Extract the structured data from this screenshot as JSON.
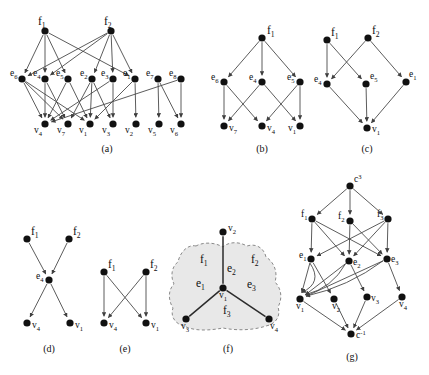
{
  "figure": {
    "background": "#ffffff",
    "node_color": "#111111",
    "edge_color": "#4a4a4a",
    "blob_fill": "#e8e8e8",
    "blob_stroke": "#8a8a8a"
  },
  "captions": {
    "a": "(a)",
    "b": "(b)",
    "c": "(c)",
    "d": "(d)",
    "e": "(e)",
    "f": "(f)",
    "g": "(g)"
  },
  "panels": {
    "a": {
      "caption": "(a)",
      "nodes": [
        {
          "id": "f1",
          "base": "f",
          "sub": "1",
          "x": 45,
          "y": 31,
          "label_dx": -7,
          "label_dy": -6,
          "big": true
        },
        {
          "id": "f2",
          "base": "f",
          "sub": "2",
          "x": 111,
          "y": 31,
          "label_dx": -7,
          "label_dy": -6,
          "big": true
        },
        {
          "id": "e6",
          "base": "e",
          "sub": "6",
          "x": 22,
          "y": 79,
          "label_dx": -12,
          "label_dy": -3
        },
        {
          "id": "e4",
          "base": "e",
          "sub": "4",
          "x": 45,
          "y": 79,
          "label_dx": -12,
          "label_dy": -3
        },
        {
          "id": "e5",
          "base": "e",
          "sub": "5",
          "x": 68,
          "y": 79,
          "label_dx": -12,
          "label_dy": -3
        },
        {
          "id": "e2",
          "base": "e",
          "sub": "2",
          "x": 92,
          "y": 79,
          "label_dx": -12,
          "label_dy": -3
        },
        {
          "id": "e3",
          "base": "e",
          "sub": "3",
          "x": 113,
          "y": 79,
          "label_dx": -12,
          "label_dy": -3
        },
        {
          "id": "e1",
          "base": "e",
          "sub": "1",
          "x": 135,
          "y": 79,
          "label_dx": -12,
          "label_dy": -3
        },
        {
          "id": "e7",
          "base": "e",
          "sub": "7",
          "x": 158,
          "y": 79,
          "label_dx": -12,
          "label_dy": -3
        },
        {
          "id": "e8",
          "base": "e",
          "sub": "8",
          "x": 181,
          "y": 79,
          "label_dx": -12,
          "label_dy": -3
        },
        {
          "id": "v4",
          "base": "v",
          "sub": "4",
          "x": 45,
          "y": 124,
          "label_dx": -11,
          "label_dy": 9
        },
        {
          "id": "v7",
          "base": "v",
          "sub": "7",
          "x": 68,
          "y": 124,
          "label_dx": -11,
          "label_dy": 9
        },
        {
          "id": "v1",
          "base": "v",
          "sub": "1",
          "x": 90,
          "y": 124,
          "label_dx": -11,
          "label_dy": 9
        },
        {
          "id": "v3",
          "base": "v",
          "sub": "3",
          "x": 113,
          "y": 124,
          "label_dx": -11,
          "label_dy": 9
        },
        {
          "id": "v2",
          "base": "v",
          "sub": "2",
          "x": 136,
          "y": 124,
          "label_dx": -11,
          "label_dy": 9
        },
        {
          "id": "v5",
          "base": "v",
          "sub": "5",
          "x": 159,
          "y": 124,
          "label_dx": -11,
          "label_dy": 9
        },
        {
          "id": "v6",
          "base": "v",
          "sub": "6",
          "x": 181,
          "y": 124,
          "label_dx": -11,
          "label_dy": 9
        }
      ],
      "edges": [
        {
          "from": "f1",
          "to": "e6"
        },
        {
          "from": "f1",
          "to": "e4"
        },
        {
          "from": "f1",
          "to": "e5"
        },
        {
          "from": "f1",
          "to": "e1"
        },
        {
          "from": "f2",
          "to": "e6"
        },
        {
          "from": "f2",
          "to": "e2"
        },
        {
          "from": "f2",
          "to": "e3"
        },
        {
          "from": "f2",
          "to": "e1"
        },
        {
          "from": "f2",
          "to": "e4"
        },
        {
          "from": "e6",
          "to": "v4"
        },
        {
          "from": "e6",
          "to": "v7"
        },
        {
          "from": "e6",
          "to": "v1"
        },
        {
          "from": "e4",
          "to": "v4"
        },
        {
          "from": "e4",
          "to": "v7"
        },
        {
          "from": "e5",
          "to": "v4"
        },
        {
          "from": "e5",
          "to": "v1"
        },
        {
          "from": "e2",
          "to": "v1"
        },
        {
          "from": "e2",
          "to": "v3"
        },
        {
          "from": "e2",
          "to": "v7"
        },
        {
          "from": "e3",
          "to": "v3"
        },
        {
          "from": "e3",
          "to": "v4"
        },
        {
          "from": "e1",
          "to": "v2"
        },
        {
          "from": "e1",
          "to": "v1"
        },
        {
          "from": "e7",
          "to": "v5"
        },
        {
          "from": "e7",
          "to": "v6"
        },
        {
          "from": "e8",
          "to": "v6"
        },
        {
          "from": "e8",
          "to": "v4"
        }
      ]
    },
    "b": {
      "caption": "(b)",
      "nodes": [
        {
          "id": "f1",
          "base": "f",
          "sub": "1",
          "x": 262,
          "y": 38,
          "label_dx": 5,
          "label_dy": -4,
          "big": true
        },
        {
          "id": "e6",
          "base": "e",
          "sub": "6",
          "x": 224,
          "y": 82,
          "label_dx": -13,
          "label_dy": -2
        },
        {
          "id": "e4",
          "base": "e",
          "sub": "4",
          "x": 262,
          "y": 82,
          "label_dx": -13,
          "label_dy": -2
        },
        {
          "id": "e5",
          "base": "e",
          "sub": "5",
          "x": 300,
          "y": 82,
          "label_dx": -13,
          "label_dy": -2
        },
        {
          "id": "v7",
          "base": "v",
          "sub": "7",
          "x": 224,
          "y": 126,
          "label_dx": 5,
          "label_dy": 5
        },
        {
          "id": "v4",
          "base": "v",
          "sub": "4",
          "x": 262,
          "y": 126,
          "label_dx": 5,
          "label_dy": 5
        },
        {
          "id": "v1",
          "base": "v",
          "sub": "1",
          "x": 300,
          "y": 126,
          "label_dx": -12,
          "label_dy": 5
        }
      ],
      "edges": [
        {
          "from": "f1",
          "to": "e6"
        },
        {
          "from": "f1",
          "to": "e4"
        },
        {
          "from": "f1",
          "to": "e5"
        },
        {
          "from": "e6",
          "to": "v7"
        },
        {
          "from": "e6",
          "to": "v4"
        },
        {
          "from": "e4",
          "to": "v7"
        },
        {
          "from": "e4",
          "to": "v1"
        },
        {
          "from": "e5",
          "to": "v4"
        },
        {
          "from": "e5",
          "to": "v1"
        }
      ]
    },
    "c": {
      "caption": "(c)",
      "nodes": [
        {
          "id": "f1",
          "base": "f",
          "sub": "1",
          "x": 327,
          "y": 40,
          "label_dx": 4,
          "label_dy": -4,
          "big": true
        },
        {
          "id": "f2",
          "base": "f",
          "sub": "2",
          "x": 368,
          "y": 38,
          "label_dx": 4,
          "label_dy": -4,
          "big": true
        },
        {
          "id": "e4",
          "base": "e",
          "sub": "4",
          "x": 327,
          "y": 84,
          "label_dx": -13,
          "label_dy": -2
        },
        {
          "id": "e5",
          "base": "e",
          "sub": "5",
          "x": 366,
          "y": 84,
          "label_dx": 4,
          "label_dy": -5
        },
        {
          "id": "e1",
          "base": "e",
          "sub": "1",
          "x": 406,
          "y": 82,
          "label_dx": 3,
          "label_dy": -5
        },
        {
          "id": "v1",
          "base": "v",
          "sub": "1",
          "x": 367,
          "y": 128,
          "label_dx": 5,
          "label_dy": 4
        }
      ],
      "edges": [
        {
          "from": "f1",
          "to": "e4"
        },
        {
          "from": "f1",
          "to": "e5"
        },
        {
          "from": "f2",
          "to": "e4"
        },
        {
          "from": "f2",
          "to": "e1"
        },
        {
          "from": "e4",
          "to": "v1"
        },
        {
          "from": "e5",
          "to": "v1"
        },
        {
          "from": "e1",
          "to": "v1"
        }
      ]
    },
    "d": {
      "caption": "(d)",
      "nodes": [
        {
          "id": "f1",
          "base": "f",
          "sub": "1",
          "x": 27,
          "y": 239,
          "label_dx": 4,
          "label_dy": -4,
          "big": true
        },
        {
          "id": "f2",
          "base": "f",
          "sub": "2",
          "x": 69,
          "y": 239,
          "label_dx": 4,
          "label_dy": -4,
          "big": true
        },
        {
          "id": "e4",
          "base": "e",
          "sub": "4",
          "x": 49,
          "y": 280,
          "label_dx": -13,
          "label_dy": -1
        },
        {
          "id": "v4",
          "base": "v",
          "sub": "4",
          "x": 27,
          "y": 323,
          "label_dx": 5,
          "label_dy": 5
        },
        {
          "id": "v1",
          "base": "v",
          "sub": "1",
          "x": 70,
          "y": 323,
          "label_dx": 5,
          "label_dy": 5
        }
      ],
      "edges": [
        {
          "from": "f1",
          "to": "e4"
        },
        {
          "from": "f2",
          "to": "e4"
        },
        {
          "from": "e4",
          "to": "v4"
        },
        {
          "from": "e4",
          "to": "v1"
        }
      ]
    },
    "e": {
      "caption": "(e)",
      "nodes": [
        {
          "id": "f1",
          "base": "f",
          "sub": "1",
          "x": 104,
          "y": 272,
          "label_dx": 4,
          "label_dy": -4,
          "big": true
        },
        {
          "id": "f2",
          "base": "f",
          "sub": "2",
          "x": 146,
          "y": 272,
          "label_dx": 4,
          "label_dy": -4,
          "big": true
        },
        {
          "id": "v4",
          "base": "v",
          "sub": "4",
          "x": 104,
          "y": 323,
          "label_dx": 5,
          "label_dy": 5
        },
        {
          "id": "v1",
          "base": "v",
          "sub": "1",
          "x": 146,
          "y": 323,
          "label_dx": 5,
          "label_dy": 5
        }
      ],
      "edges": [
        {
          "from": "f1",
          "to": "v4"
        },
        {
          "from": "f1",
          "to": "v1"
        },
        {
          "from": "f2",
          "to": "v4"
        },
        {
          "from": "f2",
          "to": "v1"
        }
      ]
    },
    "f": {
      "caption": "(f)",
      "nodes": [
        {
          "id": "v2",
          "base": "v",
          "sub": "2",
          "x": 223,
          "y": 232,
          "label_dx": 5,
          "label_dy": -1
        },
        {
          "id": "v1",
          "base": "v",
          "sub": "1",
          "x": 223,
          "y": 288,
          "label_dx": -4,
          "label_dy": 10
        },
        {
          "id": "v3",
          "base": "v",
          "sub": "3",
          "x": 186,
          "y": 319,
          "label_dx": -5,
          "label_dy": 10
        },
        {
          "id": "v4",
          "base": "v",
          "sub": "4",
          "x": 269,
          "y": 319,
          "label_dx": 1,
          "label_dy": 10
        }
      ],
      "edges": [
        {
          "from": "v1",
          "to": "v2",
          "undirected": true
        },
        {
          "from": "v1",
          "to": "v3",
          "undirected": true
        },
        {
          "from": "v1",
          "to": "v4",
          "undirected": true
        }
      ],
      "edge_labels": [
        {
          "text": "e",
          "sub": "1",
          "x": 196,
          "y": 287
        },
        {
          "text": "e",
          "sub": "2",
          "x": 227,
          "y": 272
        },
        {
          "text": "e",
          "sub": "3",
          "x": 247,
          "y": 288
        }
      ],
      "face_labels": [
        {
          "text": "f",
          "sub": "1",
          "x": 200,
          "y": 263
        },
        {
          "text": "f",
          "sub": "2",
          "x": 251,
          "y": 263
        },
        {
          "text": "f",
          "sub": "3",
          "x": 223,
          "y": 314
        }
      ]
    },
    "g": {
      "caption": "(g)",
      "nodes": [
        {
          "id": "c3",
          "base": "c",
          "sup": "3",
          "x": 350,
          "y": 186,
          "label_dx": 4,
          "label_dy": -4
        },
        {
          "id": "f1",
          "base": "f",
          "sub": "1",
          "x": 312,
          "y": 219,
          "label_dx": -11,
          "label_dy": -2
        },
        {
          "id": "f2",
          "base": "f",
          "sub": "2",
          "x": 350,
          "y": 221,
          "label_dx": -12,
          "label_dy": -2
        },
        {
          "id": "f3",
          "base": "f",
          "sub": "3",
          "x": 388,
          "y": 219,
          "label_dx": -11,
          "label_dy": -2
        },
        {
          "id": "e1",
          "base": "e",
          "sub": "1",
          "x": 311,
          "y": 259,
          "label_dx": -12,
          "label_dy": -1
        },
        {
          "id": "e2",
          "base": "e",
          "sub": "2",
          "x": 349,
          "y": 261,
          "label_dx": 4,
          "label_dy": 4
        },
        {
          "id": "e3",
          "base": "e",
          "sub": "3",
          "x": 387,
          "y": 259,
          "label_dx": 4,
          "label_dy": 3
        },
        {
          "id": "v1",
          "base": "v",
          "sub": "1",
          "x": 300,
          "y": 299,
          "label_dx": -4,
          "label_dy": 10
        },
        {
          "id": "v2",
          "base": "v",
          "sub": "2",
          "x": 334,
          "y": 299,
          "label_dx": -2,
          "label_dy": 10
        },
        {
          "id": "v3",
          "base": "v",
          "sub": "3",
          "x": 367,
          "y": 297,
          "label_dx": 4,
          "label_dy": 4
        },
        {
          "id": "v4",
          "base": "v",
          "sub": "4",
          "x": 402,
          "y": 297,
          "label_dx": -3,
          "label_dy": 10
        },
        {
          "id": "cinv",
          "base": "c",
          "sup": "-1",
          "x": 351,
          "y": 334,
          "label_dx": 5,
          "label_dy": 4
        }
      ],
      "edges": [
        {
          "from": "c3",
          "to": "f1"
        },
        {
          "from": "c3",
          "to": "f2"
        },
        {
          "from": "c3",
          "to": "f3"
        },
        {
          "from": "f1",
          "to": "e1"
        },
        {
          "from": "f1",
          "to": "e2"
        },
        {
          "from": "f1",
          "to": "e3"
        },
        {
          "from": "f2",
          "to": "e2"
        },
        {
          "from": "f2",
          "to": "e3"
        },
        {
          "from": "f3",
          "to": "e1"
        },
        {
          "from": "f3",
          "to": "e2"
        },
        {
          "from": "f3",
          "to": "e3"
        },
        {
          "from": "e1",
          "to": "v1"
        },
        {
          "from": "e1",
          "to": "v2"
        },
        {
          "from": "e2",
          "to": "v1"
        },
        {
          "from": "e2",
          "to": "v3"
        },
        {
          "from": "e3",
          "to": "v1"
        },
        {
          "from": "e3",
          "to": "v4"
        },
        {
          "from": "e1",
          "to": "v1",
          "curve": -18
        },
        {
          "from": "e2",
          "to": "v1",
          "curve": -11
        },
        {
          "from": "e3",
          "to": "v1",
          "curve": -9
        },
        {
          "from": "v1",
          "to": "cinv"
        },
        {
          "from": "v2",
          "to": "cinv"
        },
        {
          "from": "v3",
          "to": "cinv"
        },
        {
          "from": "v4",
          "to": "cinv"
        }
      ]
    }
  }
}
